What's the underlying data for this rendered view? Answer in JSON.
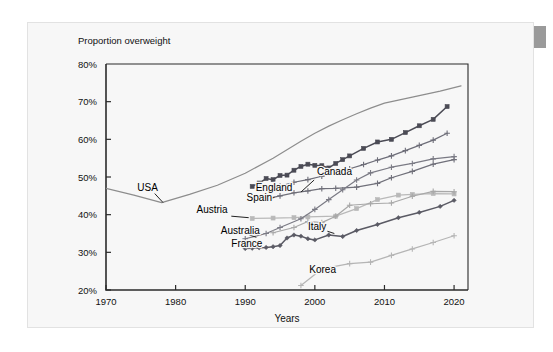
{
  "card": {
    "background_color": "#f7f7f7",
    "border_color": "#e2e2e2"
  },
  "corner_marker": {
    "name": "scrollbar-thumb",
    "color": "#9a9a9a"
  },
  "chart_data": {
    "type": "line",
    "title": "Proportion overweight",
    "xlabel": "Years",
    "ylabel": "",
    "xlim": [
      1970,
      2022
    ],
    "ylim": [
      20,
      80
    ],
    "xticks": [
      1970,
      1980,
      1990,
      2000,
      2010,
      2020
    ],
    "xtick_labels": [
      "1970",
      "1980",
      "1990",
      "2000",
      "2010",
      "2020"
    ],
    "yticks": [
      20,
      30,
      40,
      50,
      60,
      70,
      80
    ],
    "ytick_labels": [
      "20%",
      "30%",
      "40%",
      "50%",
      "60%",
      "70%",
      "80%"
    ],
    "grid": false,
    "legend": "inline-labels",
    "series": [
      {
        "name": "USA",
        "color": "#8d8d8d",
        "marker": "none",
        "label_x": 1974.5,
        "label_y": 46.4,
        "leader": [
          [
            1977.0,
            45.6
          ],
          [
            1978.2,
            43.2
          ]
        ],
        "x": [
          1970,
          1974,
          1978,
          1982,
          1986,
          1990,
          1994,
          1998,
          2000,
          2002,
          2004,
          2006,
          2008,
          2010,
          2012,
          2014,
          2016,
          2018,
          2021
        ],
        "y": [
          47.0,
          45.2,
          43.2,
          45.4,
          47.8,
          51.0,
          55.0,
          59.5,
          61.6,
          63.5,
          65.2,
          66.8,
          68.3,
          69.6,
          70.4,
          71.2,
          72.0,
          72.8,
          74.2
        ]
      },
      {
        "name": "Canada",
        "color": "#4b4b55",
        "marker": "square",
        "label_x": 2000.3,
        "label_y": 50.4,
        "leader": [
          [
            1999.9,
            49.2
          ],
          [
            1998.0,
            46.0
          ]
        ],
        "x": [
          1991,
          1992,
          1993,
          1994,
          1995,
          1996,
          1997,
          1998,
          1999,
          2000,
          2001,
          2002,
          2003,
          2004,
          2005,
          2007,
          2009,
          2011,
          2013,
          2015,
          2017,
          2019
        ],
        "y": [
          47.5,
          48.4,
          49.6,
          49.3,
          50.4,
          50.5,
          51.8,
          52.8,
          53.4,
          53.1,
          53.0,
          52.4,
          53.6,
          54.6,
          55.6,
          57.6,
          59.3,
          60.0,
          61.8,
          63.6,
          65.3,
          68.7
        ]
      },
      {
        "name": "England",
        "color": "#6d6d78",
        "marker": "plus",
        "label_x": 1991.5,
        "label_y": 46.2,
        "leader": [
          [
            1994.6,
            46.8
          ],
          [
            1995.4,
            47.6
          ]
        ],
        "x": [
          1993,
          1995,
          1997,
          1999,
          2001,
          2003,
          2005,
          2007,
          2009,
          2011,
          2013,
          2015,
          2017,
          2019
        ],
        "y": [
          46.2,
          47.6,
          48.6,
          49.3,
          50.2,
          51.0,
          52.2,
          53.3,
          54.5,
          55.6,
          57.0,
          58.4,
          59.8,
          61.6
        ]
      },
      {
        "name": "Spain",
        "color": "#6f6f79",
        "marker": "plus",
        "label_x": 1990.2,
        "label_y": 43.6,
        "leader": [
          [
            1993.0,
            43.9
          ],
          [
            1994.2,
            44.6
          ]
        ],
        "x": [
          1993,
          1995,
          1997,
          1999,
          2001,
          2003,
          2006,
          2009,
          2011,
          2014,
          2017,
          2020
        ],
        "y": [
          44.2,
          45.0,
          45.8,
          46.3,
          46.9,
          47.0,
          47.3,
          48.3,
          49.8,
          51.5,
          53.4,
          54.6
        ]
      },
      {
        "name": "Austria",
        "color": "#b9b9b9",
        "marker": "square",
        "label_x": 1983.0,
        "label_y": 40.4,
        "leader": [
          [
            1988.0,
            39.6
          ],
          [
            1990.5,
            39.2
          ]
        ],
        "x": [
          1991,
          1994,
          1997,
          1999,
          2003,
          2006,
          2009,
          2012,
          2014,
          2017,
          2020
        ],
        "y": [
          39.0,
          39.1,
          39.2,
          39.4,
          39.6,
          41.6,
          44.0,
          45.2,
          45.4,
          45.6,
          45.5
        ]
      },
      {
        "name": "Australia",
        "color": "#7a7a84",
        "marker": "plus",
        "label_x": 1986.5,
        "label_y": 34.8,
        "leader": [
          [
            1990.6,
            34.6
          ],
          [
            1991.6,
            34.0
          ]
        ],
        "x": [
          1990,
          1993,
          1995,
          1998,
          2000,
          2002,
          2004,
          2006,
          2008,
          2011,
          2014,
          2017,
          2020
        ],
        "y": [
          33.6,
          35.0,
          36.6,
          38.9,
          41.4,
          44.0,
          46.6,
          49.2,
          51.1,
          52.6,
          53.6,
          54.8,
          55.4
        ]
      },
      {
        "name": "France",
        "color": "#5a5a64",
        "marker": "diamond",
        "label_x": 1988.0,
        "label_y": 31.4,
        "leader": [
          [
            1990.4,
            31.6
          ],
          [
            1991.0,
            31.2
          ]
        ],
        "x": [
          1990,
          1991,
          1992,
          1993,
          1994,
          1995,
          1996,
          1997,
          1998,
          1999,
          2000,
          2002,
          2004,
          2006,
          2009,
          2012,
          2015,
          2018,
          2020
        ],
        "y": [
          31.0,
          31.1,
          31.2,
          31.3,
          31.5,
          31.8,
          33.8,
          34.6,
          34.3,
          33.6,
          33.3,
          34.6,
          34.2,
          35.8,
          37.4,
          39.2,
          40.6,
          42.2,
          43.8
        ]
      },
      {
        "name": "Italy",
        "color": "#a8a8a8",
        "marker": "plus",
        "label_x": 1999.0,
        "label_y": 35.9,
        "leader": [
          [
            2001.8,
            35.6
          ],
          [
            2002.8,
            35.0
          ]
        ],
        "x": [
          1994,
          1997,
          1999,
          2001,
          2003,
          2005,
          2008,
          2011,
          2014,
          2017,
          2020
        ],
        "y": [
          35.2,
          36.6,
          38.2,
          37.9,
          39.6,
          42.5,
          42.9,
          43.1,
          44.9,
          46.2,
          46.1
        ]
      },
      {
        "name": "Korea",
        "color": "#b5b5b5",
        "marker": "plus",
        "label_x": 1999.2,
        "label_y": 24.4,
        "leader": [
          [
            2001.4,
            24.8
          ],
          [
            2002.2,
            25.4
          ]
        ],
        "x": [
          1998,
          2001,
          2005,
          2008,
          2011,
          2014,
          2017,
          2020
        ],
        "y": [
          21.2,
          25.6,
          27.0,
          27.4,
          29.2,
          30.9,
          32.6,
          34.4
        ]
      }
    ]
  }
}
